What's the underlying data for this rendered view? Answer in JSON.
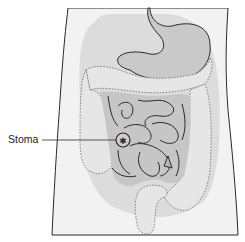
{
  "figure": {
    "labels": [
      {
        "text": "Stoma",
        "target": "stoma"
      }
    ],
    "structures": [
      "body-outline",
      "abdominal-cavity",
      "stomach",
      "colon",
      "small-intestine",
      "stoma"
    ]
  },
  "colors": {
    "background": "#ffffff",
    "body_fill": "#f1f1f1",
    "cavity_fill": "#d9d9d9",
    "organ_fill": "#c4c4c4",
    "colon_fill": "#e4e4e4",
    "outline": "#2a2a2a",
    "dotted_outline": "#666666"
  }
}
